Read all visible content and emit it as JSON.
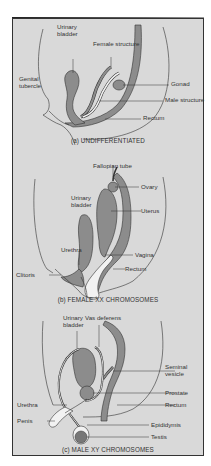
{
  "figure": {
    "colors": {
      "background": "#d9d9d9",
      "organ": "#8c8c8c",
      "outline": "#333333",
      "cavity": "#f2f2f2"
    },
    "panels": [
      {
        "id": "a",
        "caption": "(a) UNDIFFERENTIATED",
        "labels": {
          "urinary_bladder": "Urinary\nbladder",
          "female_structure": "Female structure",
          "genital_tubercle": "Genital\ntubercle",
          "gonad": "Gonad",
          "male_structure": "Male structure",
          "rectum": "Rectum"
        }
      },
      {
        "id": "b",
        "caption": "(b) FEMALE XX CHROMOSOMES",
        "labels": {
          "fallopian_tube": "Fallopian tube",
          "urinary_bladder": "Urinary\nbladder",
          "ovary": "Ovary",
          "uterus": "Uterus",
          "urethra": "Urethra",
          "vagina": "Vagina",
          "rectum": "Rectum",
          "clitoris": "Clitoris"
        }
      },
      {
        "id": "c",
        "caption": "(c) MALE XY CHROMOSOMES",
        "labels": {
          "urinary_bladder": "Urinary\nbladder",
          "vas_deferens": "Vas deferens",
          "seminal_vesicle": "Seminal\nvesicle",
          "prostate": "Prostate",
          "urethra": "Urethra",
          "rectum": "Rectum",
          "penis": "Penis",
          "epididymis": "Epididymis",
          "testis": "Testis"
        }
      }
    ]
  }
}
